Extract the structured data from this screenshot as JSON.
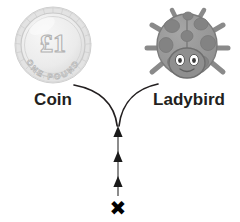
{
  "diagram": {
    "type": "branching-arrow-diagram",
    "title": "",
    "background_color": "#ffffff",
    "nodes": [
      {
        "id": "coin",
        "icon": "one-pound-coin-icon",
        "label": "Coin",
        "label_color": "#231f20",
        "coin": {
          "denomination": "£1",
          "inscription": "ONE POUND",
          "body_color": "#ebebeb",
          "edge_color": "#c9c9c9",
          "engraving_color": "#b9b9b9"
        }
      },
      {
        "id": "ladybird",
        "icon": "ladybird-icon",
        "label": "Ladybird",
        "label_color": "#231f20",
        "ladybird": {
          "body_color": "#9a9a9a",
          "spot_color": "#838383",
          "head_color": "#8f8f8f",
          "leg_color": "#8a8a8a",
          "eye_color": "#ffffff",
          "pupil_color": "#3a3a3a",
          "outline_color": "#6f6f6f",
          "spot_count": 8,
          "leg_count": 6,
          "antenna_count": 2
        }
      }
    ],
    "connector": {
      "name": "y-branch-connector",
      "stroke_color": "#231f20",
      "stroke_width": 1.6,
      "junction_x": 118,
      "junction_y": 126
    },
    "stem": {
      "name": "upward-progress-arrow",
      "line_color": "#8c8c8c",
      "arrowhead_color": "#1a1a1a",
      "arrowhead_count": 3,
      "direction": "up",
      "x": 118,
      "top_y": 126,
      "bottom_y": 198
    },
    "start_marker": {
      "name": "cross-marker",
      "glyph": "✖",
      "color": "#000000",
      "x": 118,
      "y": 208
    }
  }
}
